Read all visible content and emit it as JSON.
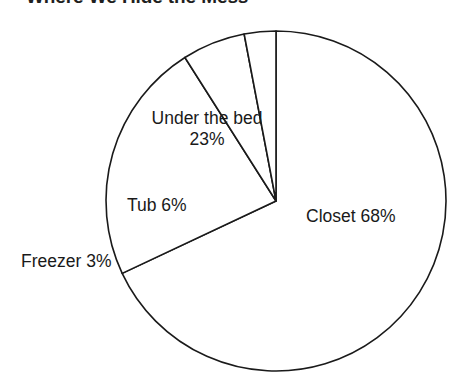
{
  "title": "Where We Hide the Mess",
  "chart_data": {
    "type": "pie",
    "title": "Where We Hide the Mess",
    "xlabel": "",
    "ylabel": "",
    "categories": [
      "Closet",
      "Under the bed",
      "Tub",
      "Freezer"
    ],
    "values": [
      68,
      23,
      6,
      3
    ],
    "units": "%",
    "total": 100,
    "start_angle_deg": 0,
    "direction": "clockwise",
    "legend": "none",
    "grid": false,
    "fill": "#ffffff",
    "stroke": "#1a1a1a",
    "labels_inside": true,
    "slices": [
      {
        "name": "Closet",
        "value": 68,
        "label": "Closet 68%",
        "label_line1": "Closet 68%",
        "label_line2": "",
        "sweep_deg": 244.8,
        "placement": "inside-right"
      },
      {
        "name": "Under the bed",
        "value": 23,
        "label": "Under the bed 23%",
        "label_line1": "Under the bed",
        "label_line2": "23%",
        "sweep_deg": 82.8,
        "placement": "inside-upper-left"
      },
      {
        "name": "Tub",
        "value": 6,
        "label": "Tub 6%",
        "label_line1": "Tub 6%",
        "label_line2": "",
        "sweep_deg": 21.6,
        "placement": "inside-left"
      },
      {
        "name": "Freezer",
        "value": 3,
        "label": "Freezer 3%",
        "label_line1": "Freezer 3%",
        "label_line2": "",
        "sweep_deg": 10.8,
        "placement": "outside-left"
      }
    ]
  },
  "geometry": {
    "cx": 276,
    "cy": 201,
    "r": 170
  }
}
